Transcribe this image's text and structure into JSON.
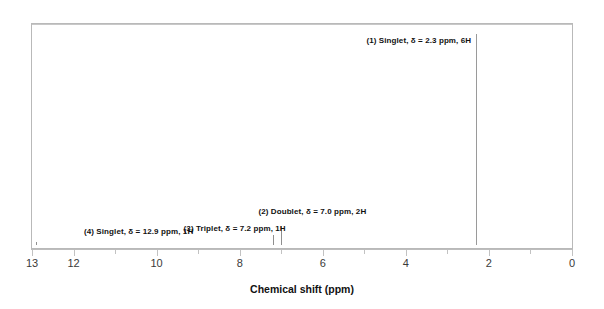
{
  "chart_data": {
    "type": "line",
    "title": "",
    "subtitle": "",
    "xlabel": "Chemical shift (ppm)",
    "ylabel": "",
    "xlim": [
      13,
      0
    ],
    "x_axis_reversed": true,
    "grid": false,
    "legend_position": "none",
    "tick_labels": [
      "13",
      "12",
      "10",
      "8",
      "6",
      "4",
      "2",
      "0"
    ],
    "tick_values": [
      13,
      12,
      10,
      8,
      6,
      4,
      2,
      0
    ],
    "minor_tick_values": [
      11,
      9,
      7,
      5,
      3,
      1
    ],
    "baseline_y_fraction": 0.985,
    "peaks": [
      {
        "id": "peak-1",
        "index": "(1)",
        "multiplicity": "Singlet",
        "shift_ppm": 2.3,
        "protons": "6H",
        "relative_height": 0.955,
        "label": "(1) Singlet, δ = 2.3 ppm, 6H",
        "label_x_ppm": 4.95,
        "label_y_fraction": 0.055
      },
      {
        "id": "peak-2",
        "index": "(2)",
        "multiplicity": "Doublet",
        "shift_ppm": 7.0,
        "protons": "2H",
        "relative_height": 0.085,
        "label": "(2) Doublet, δ = 7.0 ppm, 2H",
        "label_x_ppm": 7.55,
        "label_y_fraction": 0.815
      },
      {
        "id": "peak-3",
        "index": "(3)",
        "multiplicity": "Triplet",
        "shift_ppm": 7.2,
        "protons": "1H",
        "relative_height": 0.045,
        "label": "(3) Triplet, δ = 7.2 ppm, 1H",
        "label_x_ppm": 9.35,
        "label_y_fraction": 0.895
      },
      {
        "id": "peak-4",
        "index": "(4)",
        "multiplicity": "Singlet",
        "shift_ppm": 12.9,
        "protons": "1H",
        "relative_height": 0.012,
        "label": "(4) Singlet, δ = 12.9 ppm, 1H",
        "label_x_ppm": 11.75,
        "label_y_fraction": 0.905
      }
    ],
    "colors": {
      "background": "#ffffff",
      "frame": "#b9b9b9",
      "trace": "#8f8f8f",
      "axis": "#bdbdbd",
      "text": "#111111",
      "tick_text": "#3a3a3a"
    }
  }
}
